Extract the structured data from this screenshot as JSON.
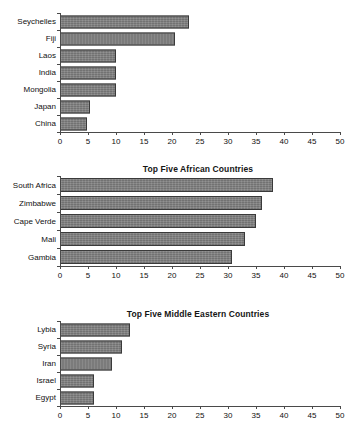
{
  "chart_data": [
    {
      "type": "bar",
      "orientation": "horizontal",
      "title": "",
      "categories": [
        "Seychelles",
        "Fiji",
        "Laos",
        "India",
        "Mongolia",
        "Japan",
        "China"
      ],
      "values": [
        23,
        20.6,
        10,
        10,
        10,
        5.3,
        4.8
      ],
      "xlabel": "",
      "ylabel": "",
      "xlim": [
        0,
        50
      ],
      "xticks": [
        0,
        5,
        10,
        15,
        20,
        25,
        30,
        35,
        40,
        45,
        50
      ],
      "grid": false,
      "legend": "none",
      "bar_color": "#7d7d7d",
      "bar_border_color": "#3a3a3a"
    },
    {
      "type": "bar",
      "orientation": "horizontal",
      "title": "Top Five African Countries",
      "categories": [
        "South Africa",
        "Zimbabwe",
        "Cape Verde",
        "Mali",
        "Gambia"
      ],
      "values": [
        38,
        36,
        35,
        33,
        30.8
      ],
      "xlabel": "",
      "ylabel": "",
      "xlim": [
        0,
        50
      ],
      "xticks": [
        0,
        5,
        10,
        15,
        20,
        25,
        30,
        35,
        40,
        45,
        50
      ],
      "grid": false,
      "legend": "none",
      "bar_color": "#7d7d7d",
      "bar_border_color": "#3a3a3a"
    },
    {
      "type": "bar",
      "orientation": "horizontal",
      "title": "Top Five Middle Eastern Countries",
      "categories": [
        "Lybia",
        "Syria",
        "Iran",
        "Israel",
        "Egypt"
      ],
      "values": [
        12.5,
        11,
        9.3,
        6,
        6
      ],
      "xlabel": "",
      "ylabel": "",
      "xlim": [
        0,
        50
      ],
      "xticks": [
        0,
        5,
        10,
        15,
        20,
        25,
        30,
        35,
        40,
        45,
        50
      ],
      "grid": false,
      "legend": "none",
      "bar_color": "#7d7d7d",
      "bar_border_color": "#3a3a3a"
    }
  ]
}
